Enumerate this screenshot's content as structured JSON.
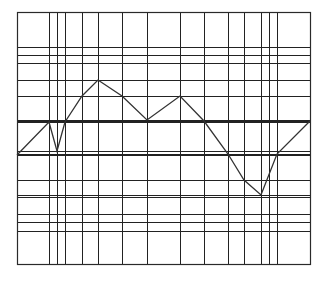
{
  "chart_data": {
    "type": "line",
    "title": "",
    "xlabel": "",
    "ylabel": "",
    "grid": true,
    "legend": null,
    "x": [
      0,
      32,
      40,
      48,
      65,
      81,
      105,
      130,
      163,
      187,
      211,
      227,
      244,
      260,
      293
    ],
    "values": [
      109,
      142,
      113,
      142,
      168,
      184,
      168,
      144,
      168,
      143,
      110,
      84,
      69,
      110,
      143
    ],
    "xlim": [
      0,
      293
    ],
    "ylim": [
      0,
      252
    ],
    "extra_vertical_gridlines": [
      252
    ],
    "extra_horizontal_gridlines": [
      33,
      42,
      50,
      67,
      201,
      209,
      217
    ],
    "line_color": "#333333",
    "grid_color": "#222222"
  },
  "plot_box": {
    "left": 17,
    "top": 12,
    "right": 310,
    "bottom": 264
  }
}
